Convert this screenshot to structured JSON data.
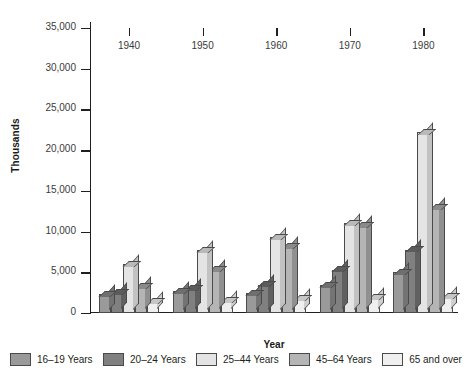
{
  "chart_data": {
    "type": "bar",
    "title": "",
    "subtitle": "",
    "xlabel": "Year",
    "ylabel": "Thousands",
    "categories": [
      "1940",
      "1950",
      "1960",
      "1970",
      "1980"
    ],
    "ylim": [
      0,
      35000
    ],
    "ytick_labels": [
      "0",
      "5,000",
      "10,000",
      "15,000",
      "20,000",
      "25,000",
      "30,000",
      "35,000"
    ],
    "ytick_values": [
      0,
      5000,
      10000,
      15000,
      20000,
      25000,
      30000,
      35000
    ],
    "grid": false,
    "legend_position": "bottom",
    "series": [
      {
        "name": "16–19 Years",
        "color": "#9a9a9a",
        "top_color": "#6f6f6f",
        "side_color": "#747474",
        "values": [
          2300,
          2700,
          2400,
          3400,
          5000
        ]
      },
      {
        "name": "20–24 Years",
        "color": "#808080",
        "top_color": "#5c5c5c",
        "side_color": "#606060",
        "values": [
          2500,
          3000,
          3500,
          5300,
          7800
        ]
      },
      {
        "name": "25–44 Years",
        "color": "#e4e4e4",
        "top_color": "#b9b9b9",
        "side_color": "#c2c2c2",
        "values": [
          6000,
          7700,
          9300,
          11000,
          22200
        ]
      },
      {
        "name": "45–64 Years",
        "color": "#b5b5b5",
        "top_color": "#8a8a8a",
        "side_color": "#909090",
        "values": [
          3200,
          5300,
          8200,
          10700,
          13000
        ]
      },
      {
        "name": "65 and over",
        "color": "#efefef",
        "top_color": "#c6c6c6",
        "side_color": "#cfcfcf",
        "values": [
          1400,
          1500,
          1800,
          1900,
          2000
        ]
      }
    ]
  }
}
